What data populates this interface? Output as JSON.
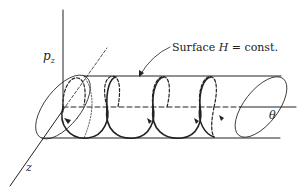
{
  "figure": {
    "labels": {
      "pz_axis": "p",
      "pz_sub": "z",
      "theta_axis": "θ",
      "z_axis": "z",
      "surface_prefix": "Surface ",
      "surface_var": "H",
      "surface_suffix": " = const."
    },
    "colors": {
      "ink": "#222222",
      "background": "#ffffff"
    }
  }
}
